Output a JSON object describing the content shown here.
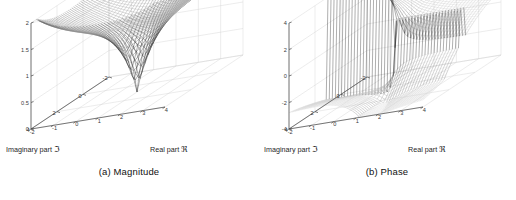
{
  "figure": {
    "type": "two-panel-3d-surface-figure",
    "background_color": "#ffffff",
    "axis_color": "#4d4d4d",
    "grid_color": "#cfcfcf",
    "mesh_color": "#222222"
  },
  "panels": [
    {
      "id": "magnitude",
      "caption": "(a) Magnitude",
      "xlabel_text": "Real part ",
      "xlabel_symbol": "ℜ",
      "ylabel_text": "Imaginary part ",
      "ylabel_symbol": "ℑ",
      "xticks": [
        "-2",
        "-1",
        "0",
        "1",
        "2",
        "3",
        "4"
      ],
      "yticks": [
        "4",
        "2",
        "0",
        "-2"
      ],
      "zticks": [
        "0",
        "0.5",
        "1",
        "1.5",
        "2"
      ]
    },
    {
      "id": "phase",
      "caption": "(b) Phase",
      "xlabel_text": "Real part ",
      "xlabel_symbol": "ℜ",
      "ylabel_text": "Imaginary part ",
      "ylabel_symbol": "ℑ",
      "xticks": [
        "-2",
        "-1",
        "0",
        "1",
        "2",
        "3",
        "4"
      ],
      "yticks": [
        "4",
        "2",
        "0",
        "-2"
      ],
      "zticks": [
        "-4",
        "-2",
        "0",
        "2",
        "4"
      ]
    }
  ],
  "chart_data": [
    {
      "type": "surface",
      "title": "(a) Magnitude",
      "xlabel": "Real part ℜ",
      "ylabel": "Imaginary part ℑ",
      "zlabel": "",
      "xlim": [
        -2,
        4
      ],
      "ylim": [
        -2,
        4
      ],
      "zlim": [
        0,
        2
      ],
      "xticks": [
        -2,
        -1,
        0,
        1,
        2,
        3,
        4
      ],
      "yticks": [
        -2,
        0,
        2,
        4
      ],
      "zticks": [
        0,
        0.5,
        1,
        1.5,
        2
      ],
      "grid": true,
      "legend": "none",
      "description": "Magnitude of a complex function over the complex plane; bowl-shaped plateau near z ~ 1.4 at the corners, saddle-like ridges rising toward the far corners, and a sharp downward conical zero (singular dip) near the center-front where the magnitude drops to 0.",
      "features": [
        {
          "name": "central-zero-cone",
          "x": 1.0,
          "y": 1.0,
          "z": 0.0
        },
        {
          "name": "corner-plateau-level",
          "z": 1.4
        },
        {
          "name": "peak-level",
          "z": 2.0
        }
      ]
    },
    {
      "type": "surface",
      "title": "(b) Phase",
      "xlabel": "Real part ℜ",
      "ylabel": "Imaginary part ℑ",
      "zlabel": "",
      "xlim": [
        -2,
        4
      ],
      "ylim": [
        -2,
        4
      ],
      "zlim": [
        -4,
        4
      ],
      "xticks": [
        -2,
        -1,
        0,
        1,
        2,
        3,
        4
      ],
      "yticks": [
        -2,
        0,
        2,
        4
      ],
      "zticks": [
        -4,
        -2,
        0,
        2,
        4
      ],
      "grid": true,
      "legend": "none",
      "description": "Phase (argument) of the same complex function; a nearly flat sheet near z ~ 0 over most of the domain with a vertical branch-cut discontinuity jumping from about -3 to +1.5 near the center, plus a steep descending fold toward the front-left region.",
      "features": [
        {
          "name": "branch-cut-jump-low",
          "z": -3.0
        },
        {
          "name": "branch-cut-jump-high",
          "z": 1.5
        },
        {
          "name": "flat-sheet-level",
          "z": 0.0
        }
      ]
    }
  ]
}
